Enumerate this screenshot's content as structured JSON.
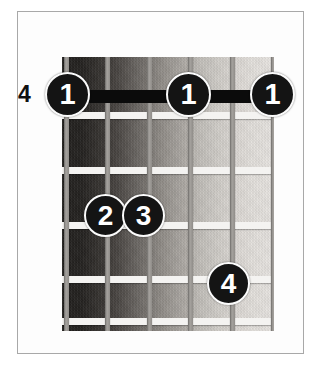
{
  "diagram": {
    "kind": "guitar-chord-diagram",
    "fret_number_label": "4",
    "frame_border_color": "#a8a8a8",
    "background_color": "#ffffff",
    "fretboard": {
      "left": 62,
      "top": 57,
      "width": 212,
      "height": 274,
      "gradient_from": "#23211f",
      "gradient_to": "#e8e5e2",
      "string_color": "#a6a39f",
      "fret_color": "#f4f3f1",
      "string_count": 6,
      "fret_count": 5,
      "string_x": [
        2,
        43,
        85,
        126,
        168,
        209
      ],
      "fret_y": [
        55,
        110,
        165,
        219,
        261
      ]
    },
    "barre": {
      "label": "1",
      "fret": 1,
      "from_string": 6,
      "to_string": 1,
      "color": "#0b0b0b",
      "left": 64,
      "top": 90,
      "width": 209,
      "height": 13
    },
    "fingers": [
      {
        "label": "1",
        "left": 45,
        "top": 72,
        "size": 45
      },
      {
        "label": "1",
        "left": 166,
        "top": 72,
        "size": 45
      },
      {
        "label": "1",
        "left": 250,
        "top": 72,
        "size": 45
      },
      {
        "label": "2",
        "left": 84,
        "top": 194,
        "size": 43
      },
      {
        "label": "3",
        "left": 122,
        "top": 194,
        "size": 43
      },
      {
        "label": "4",
        "left": 207,
        "top": 262,
        "size": 43
      }
    ],
    "fret_label_position": {
      "left": 18,
      "top": 83
    }
  }
}
